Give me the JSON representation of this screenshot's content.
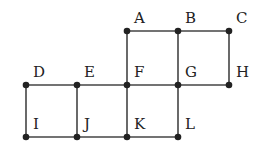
{
  "diagram": {
    "type": "grid-graph",
    "nodes": [
      {
        "id": "A",
        "label": "A",
        "x": 127,
        "y": 31
      },
      {
        "id": "B",
        "label": "B",
        "x": 178,
        "y": 31
      },
      {
        "id": "C",
        "label": "C",
        "x": 229,
        "y": 31
      },
      {
        "id": "D",
        "label": "D",
        "x": 26,
        "y": 85
      },
      {
        "id": "E",
        "label": "E",
        "x": 77,
        "y": 85
      },
      {
        "id": "F",
        "label": "F",
        "x": 127,
        "y": 85
      },
      {
        "id": "G",
        "label": "G",
        "x": 178,
        "y": 85
      },
      {
        "id": "H",
        "label": "H",
        "x": 229,
        "y": 85
      },
      {
        "id": "I",
        "label": "I",
        "x": 26,
        "y": 137
      },
      {
        "id": "J",
        "label": "J",
        "x": 77,
        "y": 137
      },
      {
        "id": "K",
        "label": "K",
        "x": 127,
        "y": 137
      },
      {
        "id": "L",
        "label": "L",
        "x": 178,
        "y": 137
      }
    ],
    "edges": [
      [
        "A",
        "B"
      ],
      [
        "B",
        "C"
      ],
      [
        "A",
        "F"
      ],
      [
        "B",
        "G"
      ],
      [
        "C",
        "H"
      ],
      [
        "D",
        "E"
      ],
      [
        "E",
        "F"
      ],
      [
        "F",
        "G"
      ],
      [
        "G",
        "H"
      ],
      [
        "D",
        "I"
      ],
      [
        "E",
        "J"
      ],
      [
        "F",
        "K"
      ],
      [
        "G",
        "L"
      ],
      [
        "I",
        "J"
      ],
      [
        "J",
        "K"
      ],
      [
        "K",
        "L"
      ]
    ],
    "colors": {
      "line": "#444444",
      "node": "#222222",
      "text": "#222222"
    }
  }
}
